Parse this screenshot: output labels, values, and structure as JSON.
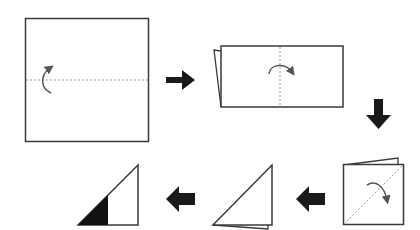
{
  "diagram": {
    "colors": {
      "outline": "#3a3a3a",
      "fold_line": "#9a9a9a",
      "arrow": "#1a1a1a",
      "fold_arrow": "#555555",
      "fill": "#ffffff",
      "shaded": "#111111"
    },
    "steps": [
      {
        "id": 1,
        "shape": "square",
        "fold": "horizontal valley fold, bottom up"
      },
      {
        "id": 2,
        "shape": "rectangle",
        "fold": "vertical fold, left to right"
      },
      {
        "id": 3,
        "shape": "small square",
        "fold": "diagonal fold"
      },
      {
        "id": 4,
        "shape": "right triangle",
        "fold": "none"
      },
      {
        "id": 5,
        "shape": "right triangle with shaded portion",
        "fold": "none"
      }
    ],
    "arrows": [
      {
        "from": 1,
        "to": 2,
        "direction": "right"
      },
      {
        "from": 2,
        "to": 3,
        "direction": "down"
      },
      {
        "from": 3,
        "to": 4,
        "direction": "left"
      },
      {
        "from": 4,
        "to": 5,
        "direction": "left"
      }
    ]
  }
}
